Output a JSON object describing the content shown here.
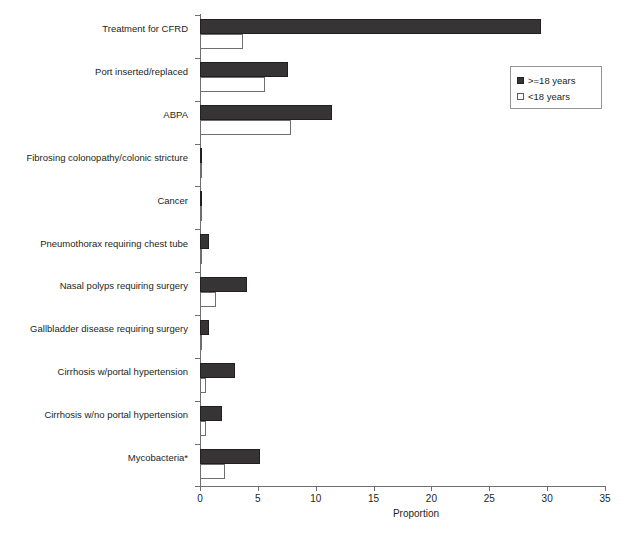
{
  "chart_data": {
    "type": "bar",
    "orientation": "horizontal",
    "title": "",
    "xlabel": "Proportion",
    "ylabel": "",
    "xlim": [
      0,
      35
    ],
    "xticks": [
      0,
      5,
      10,
      15,
      20,
      25,
      30,
      35
    ],
    "grid": false,
    "legend_position": "top-right",
    "categories": [
      "Treatment for CFRD",
      "Port inserted/replaced",
      "ABPA",
      "Fibrosing colonopathy/colonic stricture",
      "Cancer",
      "Pneumothorax requiring chest tube",
      "Nasal polyps requiring surgery",
      "Gallbladder disease requiring surgery",
      "Cirrhosis w/portal hypertension",
      "Cirrhosis w/no portal hypertension",
      "Mycobacteria*"
    ],
    "series": [
      {
        "name": ">=18 years",
        "color": "#373435",
        "values": [
          29.5,
          7.6,
          11.4,
          0.1,
          0.2,
          0.75,
          4.1,
          0.8,
          3.0,
          1.9,
          5.2
        ]
      },
      {
        "name": "<18 years",
        "color": "#ffffff",
        "values": [
          3.7,
          5.6,
          7.9,
          0.05,
          0.1,
          0.05,
          1.4,
          0.15,
          0.5,
          0.5,
          2.2
        ]
      }
    ]
  },
  "legend": {
    "items": [
      {
        "label": ">=18 years",
        "swatch": "filled-dark-square"
      },
      {
        "label": "<18 years",
        "swatch": "open-white-square"
      }
    ]
  },
  "axis": {
    "x_title": "Proportion",
    "x_tick_labels": [
      "0",
      "5",
      "10",
      "15",
      "20",
      "25",
      "30",
      "35"
    ]
  },
  "colors": {
    "adult_bar": "#373435",
    "child_bar": "#ffffff",
    "axis": "#6d6e70",
    "text": "#231f20",
    "legend_border": "#939598"
  }
}
